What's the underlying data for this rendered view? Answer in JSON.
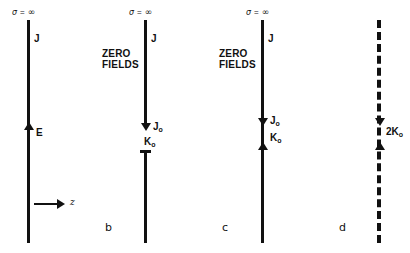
{
  "figure": {
    "background_color": "#ffffff",
    "ink_color": "#111111",
    "panels": [
      {
        "id": "a",
        "caption": "",
        "conductivity_label": {
          "symbol": "σ",
          "equals": "=",
          "value": "∞"
        },
        "current_label": "J",
        "field_label": "E",
        "axis_label": "z",
        "line_style": "solid"
      },
      {
        "id": "b",
        "caption": "b",
        "conductivity_label": {
          "symbol": "σ",
          "equals": "=",
          "value": "∞"
        },
        "current_label": "J",
        "zero_fields_line1": "ZERO",
        "zero_fields_line2": "FIELDS",
        "surface_current_label": "J",
        "surface_current_sub": "o",
        "sheet_current_label": "K",
        "sheet_current_sub": "o",
        "line_style": "solid-gap"
      },
      {
        "id": "c",
        "caption": "c",
        "conductivity_label": {
          "symbol": "σ",
          "equals": "=",
          "value": "∞"
        },
        "current_label": "J",
        "zero_fields_line1": "ZERO",
        "zero_fields_line2": "FIELDS",
        "surface_current_label": "J",
        "surface_current_sub": "o",
        "sheet_current_label": "K",
        "sheet_current_sub": "o",
        "line_style": "solid"
      },
      {
        "id": "d",
        "caption": "d",
        "doubled_sheet_label": "2K",
        "doubled_sheet_sub": "o",
        "line_style": "dashed"
      }
    ]
  }
}
